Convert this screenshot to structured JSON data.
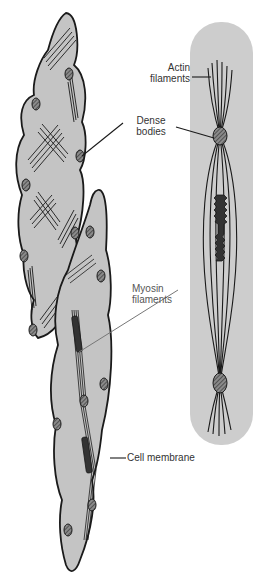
{
  "diagram": {
    "colors": {
      "cell_fill": "#c4c4c4",
      "cell_outline": "#1a1a1a",
      "single_cell_background": "#cdcdcd",
      "label_text": "#333333",
      "leader_line_dark": "#1a1a1a",
      "leader_line_light": "#777777"
    },
    "labels": {
      "actin": {
        "line1": "Actin",
        "line2": "filaments"
      },
      "dense": {
        "line1": "Dense",
        "line2": "bodies"
      },
      "myosin": {
        "line1": "Myosin",
        "line2": "filaments"
      },
      "membrane": {
        "text": "Cell membrane"
      }
    }
  }
}
